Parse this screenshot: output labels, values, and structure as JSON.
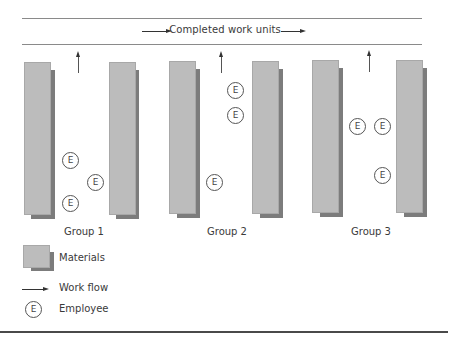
{
  "header": {
    "title": "Completed work units"
  },
  "groups": [
    {
      "label": "Group 1",
      "employees": [
        {
          "label": "E",
          "x": 62,
          "y": 152
        },
        {
          "label": "E",
          "x": 87,
          "y": 174
        },
        {
          "label": "E",
          "x": 62,
          "y": 195
        }
      ]
    },
    {
      "label": "Group 2",
      "employees": [
        {
          "label": "E",
          "x": 227,
          "y": 82
        },
        {
          "label": "E",
          "x": 227,
          "y": 107
        },
        {
          "label": "E",
          "x": 206,
          "y": 174
        }
      ]
    },
    {
      "label": "Group 3",
      "employees": [
        {
          "label": "E",
          "x": 349,
          "y": 118
        },
        {
          "label": "E",
          "x": 374,
          "y": 118
        },
        {
          "label": "E",
          "x": 374,
          "y": 167
        }
      ]
    }
  ],
  "legend": {
    "materials": "Materials",
    "work_flow": "Work flow",
    "employee": "Employee",
    "employee_symbol": "E"
  },
  "colors": {
    "material_face": "#bcbcbc",
    "material_shadow": "#7c7c7c",
    "line": "#8a8a8a",
    "text": "#3a3a3a"
  }
}
